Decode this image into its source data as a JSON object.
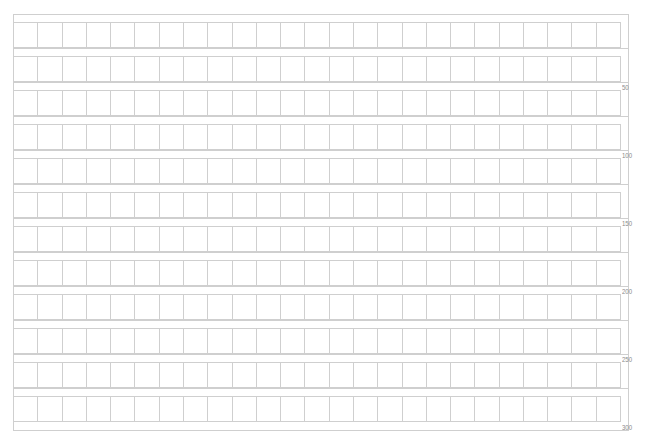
{
  "document": {
    "type": "genko-yoshi-manuscript-paper",
    "title": "",
    "grid": {
      "columns": 25,
      "rows": 12,
      "line_color": "#cfcfcf"
    },
    "count_labels": [
      "50",
      "100",
      "150",
      "200",
      "250",
      "300"
    ]
  }
}
